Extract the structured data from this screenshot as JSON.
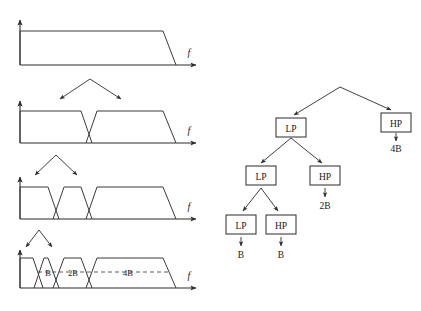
{
  "figure": {
    "axis_label": "f",
    "band_labels": [
      "B",
      "2B",
      "4B"
    ],
    "caption": ""
  },
  "spectra": [
    {
      "name": "full-band-spectrum",
      "stage": 1,
      "bands": 1,
      "labels": []
    },
    {
      "name": "two-band-spectrum",
      "stage": 2,
      "bands": 2,
      "labels": []
    },
    {
      "name": "three-band-spectrum",
      "stage": 3,
      "bands": 3,
      "labels": []
    },
    {
      "name": "four-band-spectrum",
      "stage": 4,
      "bands": 4,
      "labels": [
        "B",
        "2B",
        "4B"
      ]
    }
  ],
  "tree": {
    "nodes": [
      {
        "id": "lp1",
        "label": "LP",
        "level": 1,
        "output": null
      },
      {
        "id": "hp1",
        "label": "HP",
        "level": 1,
        "output": "4B"
      },
      {
        "id": "lp2",
        "label": "LP",
        "level": 2,
        "output": null
      },
      {
        "id": "hp2",
        "label": "HP",
        "level": 2,
        "output": "2B"
      },
      {
        "id": "lp3",
        "label": "LP",
        "level": 3,
        "output": "B"
      },
      {
        "id": "hp3",
        "label": "HP",
        "level": 3,
        "output": "B"
      }
    ],
    "outputs": [
      "4B",
      "2B",
      "B",
      "B"
    ]
  },
  "colors": {
    "stroke": "#2b2b2b",
    "spectrum": "#3a3a3a",
    "dashed": "#4a4a4a",
    "background": "#ffffff",
    "text": "#1a1a1a"
  }
}
